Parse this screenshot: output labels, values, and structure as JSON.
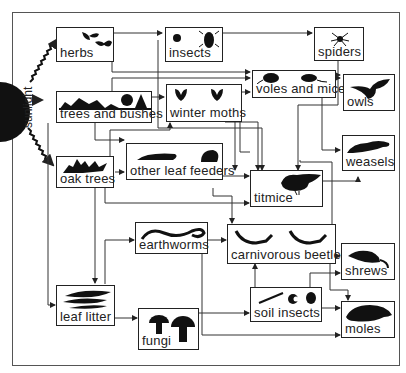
{
  "sun": {
    "label": "sunlight"
  },
  "nodes": {
    "herbs": {
      "label": "herbs"
    },
    "insects": {
      "label": "insects"
    },
    "spiders": {
      "label": "spiders"
    },
    "trees_and_bushes": {
      "label": "trees and bushes"
    },
    "winter_moths": {
      "label": "winter moths"
    },
    "voles_and_mice": {
      "label": "voles and mice"
    },
    "owls": {
      "label": "owls"
    },
    "oak_trees": {
      "label": "oak trees"
    },
    "other_leaf_feeders": {
      "label": "other leaf feeders"
    },
    "weasels": {
      "label": "weasels"
    },
    "titmice": {
      "label": "titmice"
    },
    "earthworms": {
      "label": "earthworms"
    },
    "carnivorous_beetles": {
      "label": "carnivorous beetles"
    },
    "shrews": {
      "label": "shrews"
    },
    "leaf_litter": {
      "label": "leaf litter"
    },
    "fungi": {
      "label": "fungi"
    },
    "soil_insects": {
      "label": "soil insects"
    },
    "moles": {
      "label": "moles"
    }
  },
  "edges": [
    [
      "sunlight",
      "herbs"
    ],
    [
      "sunlight",
      "trees_and_bushes"
    ],
    [
      "sunlight",
      "oak_trees"
    ],
    [
      "herbs",
      "insects"
    ],
    [
      "herbs",
      "voles_and_mice"
    ],
    [
      "insects",
      "spiders"
    ],
    [
      "insects",
      "titmice"
    ],
    [
      "spiders",
      "owls"
    ],
    [
      "spiders",
      "titmice"
    ],
    [
      "trees_and_bushes",
      "winter_moths"
    ],
    [
      "trees_and_bushes",
      "voles_and_mice"
    ],
    [
      "trees_and_bushes",
      "other_leaf_feeders"
    ],
    [
      "trees_and_bushes",
      "leaf_litter"
    ],
    [
      "winter_moths",
      "voles_and_mice"
    ],
    [
      "winter_moths",
      "titmice"
    ],
    [
      "voles_and_mice",
      "owls"
    ],
    [
      "voles_and_mice",
      "weasels"
    ],
    [
      "oak_trees",
      "winter_moths"
    ],
    [
      "oak_trees",
      "other_leaf_feeders"
    ],
    [
      "oak_trees",
      "titmice"
    ],
    [
      "oak_trees",
      "leaf_litter"
    ],
    [
      "other_leaf_feeders",
      "titmice"
    ],
    [
      "other_leaf_feeders",
      "carnivorous_beetles"
    ],
    [
      "titmice",
      "weasels"
    ],
    [
      "titmice",
      "shrews"
    ],
    [
      "earthworms",
      "carnivorous_beetles"
    ],
    [
      "earthworms",
      "moles"
    ],
    [
      "carnivorous_beetles",
      "shrews"
    ],
    [
      "carnivorous_beetles",
      "moles"
    ],
    [
      "leaf_litter",
      "earthworms"
    ],
    [
      "leaf_litter",
      "fungi"
    ],
    [
      "fungi",
      "soil_insects"
    ],
    [
      "soil_insects",
      "carnivorous_beetles"
    ],
    [
      "soil_insects",
      "shrews"
    ],
    [
      "soil_insects",
      "moles"
    ]
  ]
}
